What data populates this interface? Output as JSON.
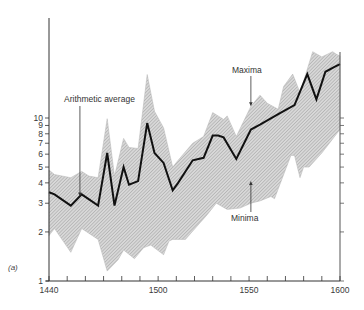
{
  "chart_data": {
    "type": "area",
    "title": "",
    "panel_label": "(a)",
    "xlabel": "",
    "ylabel": "",
    "yscale": "log",
    "xlim": [
      1440,
      1600
    ],
    "ylim": [
      1,
      41
    ],
    "grid": false,
    "legend": "none (inline annotations)",
    "x_ticks": {
      "major": [
        1440,
        1500,
        1550,
        1600
      ],
      "major_labels": [
        "1440",
        "1500",
        "1550",
        "1600"
      ],
      "minor_step": 10
    },
    "y_ticks": {
      "values": [
        1,
        2,
        3,
        4,
        5,
        6,
        7,
        8,
        9,
        10
      ],
      "labels": [
        "1",
        "2",
        "3",
        "4",
        "5",
        "6",
        "7",
        "8",
        "9",
        "10"
      ]
    },
    "annotations": [
      {
        "text": "Arithmetic average",
        "target": "average",
        "x": 1457,
        "y": 3.3
      },
      {
        "text": "Maxima",
        "target": "maxima",
        "x": 1551,
        "y": 11.8
      },
      {
        "text": "Minima",
        "target": "minima",
        "x": 1551,
        "y": 4.1
      }
    ],
    "series": [
      {
        "name": "Maxima",
        "style": "band upper edge (hatched grey fill)",
        "x": [
          1440,
          1443,
          1452,
          1458,
          1462,
          1467,
          1472,
          1476,
          1481,
          1484,
          1489,
          1494,
          1498,
          1503,
          1508,
          1511,
          1519,
          1525,
          1530,
          1533,
          1536,
          1538,
          1543,
          1551,
          1556,
          1560,
          1566,
          1569,
          1574,
          1578,
          1585,
          1590,
          1596,
          1598,
          1600
        ],
        "y": [
          4.8,
          4.5,
          4.3,
          4.7,
          4.4,
          4.3,
          9.9,
          4.4,
          7.5,
          6.6,
          6.5,
          18.5,
          11.0,
          8.7,
          5.0,
          5.5,
          7.0,
          7.7,
          10.8,
          10.3,
          9.8,
          10.3,
          7.7,
          11.8,
          13.8,
          12.3,
          11.3,
          15.6,
          18.6,
          14.3,
          25.5,
          23.7,
          25.5,
          24.6,
          24.0
        ]
      },
      {
        "name": "Arithmetic average",
        "style": "thick black line",
        "x": [
          1440,
          1443,
          1452,
          1458,
          1467,
          1472,
          1476,
          1481,
          1484,
          1489,
          1494,
          1498,
          1503,
          1508,
          1511,
          1519,
          1525,
          1530,
          1533,
          1536,
          1543,
          1551,
          1556,
          1567,
          1575,
          1582,
          1587,
          1592,
          1597,
          1600
        ],
        "y": [
          3.5,
          3.4,
          2.9,
          3.4,
          2.9,
          6.1,
          2.9,
          5.0,
          3.9,
          4.1,
          9.3,
          6.1,
          5.3,
          3.6,
          4.0,
          5.5,
          5.7,
          7.8,
          7.8,
          7.6,
          5.6,
          8.5,
          9.1,
          10.7,
          12.0,
          18.6,
          13.0,
          19.2,
          20.6,
          21.4
        ]
      },
      {
        "name": "Minima",
        "style": "band lower edge (hatched grey fill)",
        "x": [
          1440,
          1443,
          1452,
          1458,
          1467,
          1472,
          1478,
          1481,
          1487,
          1492,
          1496,
          1503,
          1506,
          1508,
          1515,
          1527,
          1532,
          1538,
          1545,
          1551,
          1556,
          1562,
          1564,
          1573,
          1575,
          1578,
          1580,
          1583,
          1590,
          1600
        ],
        "y": [
          1.9,
          2.1,
          1.5,
          2.1,
          1.8,
          1.15,
          1.35,
          1.55,
          1.37,
          1.6,
          1.66,
          1.45,
          1.76,
          1.8,
          1.8,
          2.55,
          3.0,
          2.75,
          2.8,
          3.0,
          3.1,
          3.3,
          3.2,
          5.9,
          5.9,
          4.3,
          5.0,
          5.0,
          6.1,
          8.5
        ]
      }
    ]
  }
}
